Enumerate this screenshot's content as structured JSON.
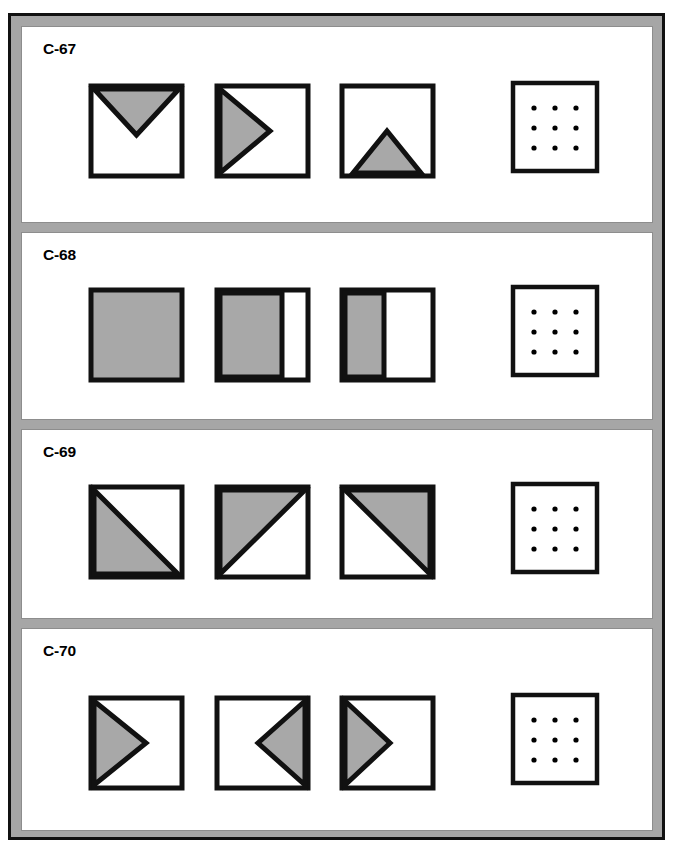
{
  "page": {
    "width": 673,
    "height": 853,
    "background": "#ffffff",
    "frame_fill": "#a6a6a6",
    "frame_border": "#111111",
    "panel_fill": "#ffffff",
    "panel_border": "#8d8d8d",
    "shape_fill_gray": "#a8a8a8",
    "shape_stroke": "#111111",
    "shape_white": "#ffffff",
    "dot_color": "#000000"
  },
  "items": [
    {
      "label": "C-67",
      "figures": [
        {
          "name": "square-downward-triangle-from-top",
          "kind": "shape",
          "description": "square with gray downward-pointing triangle spanning the top edge, apex near middle"
        },
        {
          "name": "square-right-chevron-from-left",
          "kind": "shape",
          "description": "square with gray right-pointing triangle spanning the left edge, apex near middle"
        },
        {
          "name": "square-upward-triangle-from-bottom",
          "kind": "shape",
          "description": "square with gray upward-pointing triangle rising from the bottom edge, smaller"
        },
        {
          "name": "answer-dot-grid",
          "kind": "dots",
          "description": "empty square containing a 3 by 3 grid of dots"
        }
      ]
    },
    {
      "label": "C-68",
      "figures": [
        {
          "name": "square-fully-filled",
          "kind": "shape",
          "description": "square completely filled gray",
          "fill_fraction": 1.0
        },
        {
          "name": "square-filled-left-three-quarters",
          "kind": "shape",
          "description": "square with left portion filled gray",
          "fill_fraction": 0.72
        },
        {
          "name": "square-filled-left-half",
          "kind": "shape",
          "description": "square with left portion filled gray",
          "fill_fraction": 0.45
        },
        {
          "name": "answer-dot-grid",
          "kind": "dots",
          "description": "empty square containing a 3 by 3 grid of dots"
        }
      ]
    },
    {
      "label": "C-69",
      "figures": [
        {
          "name": "square-lower-left-triangle",
          "kind": "shape",
          "description": "square split by a diagonal from top-left to bottom-right, lower-left half gray"
        },
        {
          "name": "square-upper-left-triangle",
          "kind": "shape",
          "description": "square split by a diagonal from bottom-left to top-right, upper-left half gray"
        },
        {
          "name": "square-upper-right-triangle",
          "kind": "shape",
          "description": "square split by a diagonal from top-left to bottom-right, upper-right half gray"
        },
        {
          "name": "answer-dot-grid",
          "kind": "dots",
          "description": "empty square containing a 3 by 3 grid of dots"
        }
      ]
    },
    {
      "label": "C-70",
      "figures": [
        {
          "name": "square-right-chevron-from-left-large",
          "kind": "shape",
          "description": "square with gray right-pointing triangle on the left edge, apex just past middle"
        },
        {
          "name": "square-left-chevron-from-right",
          "kind": "shape",
          "description": "square with gray left-pointing triangle on the right edge, apex left of middle"
        },
        {
          "name": "square-right-chevron-from-left-small",
          "kind": "shape",
          "description": "square with gray right-pointing triangle on the left edge, apex near middle"
        },
        {
          "name": "answer-dot-grid",
          "kind": "dots",
          "description": "empty square containing a 3 by 3 grid of dots"
        }
      ]
    }
  ]
}
